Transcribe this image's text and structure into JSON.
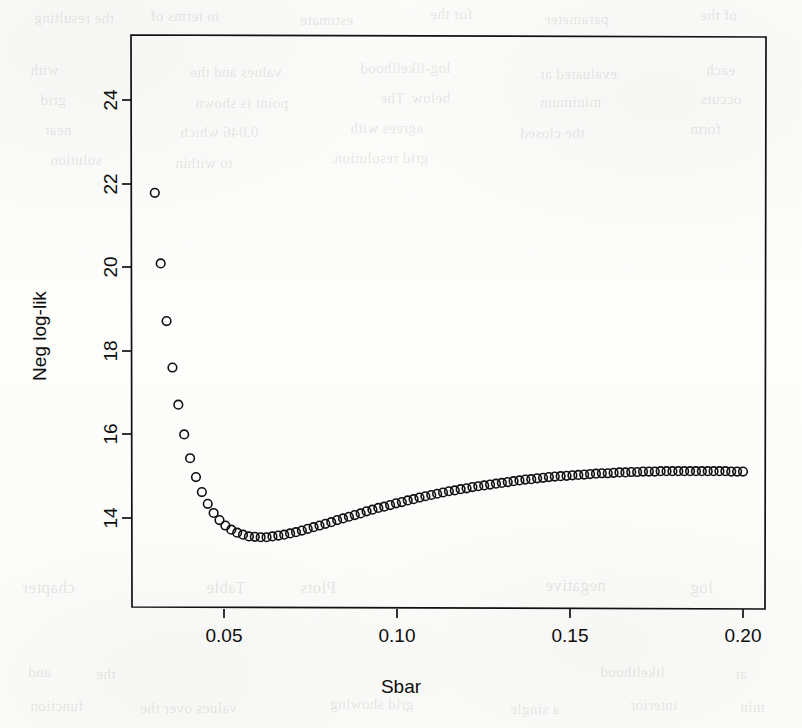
{
  "figure": {
    "background_color": "#fdfdfc",
    "ink_color": "#111111",
    "title": "",
    "xlabel": "Sbar",
    "ylabel": "Neg log-lik"
  },
  "ghost_text": [
    {
      "t": "the resulting",
      "x": 34,
      "y": 10,
      "s": 15
    },
    {
      "t": "in terms of",
      "x": 150,
      "y": 8,
      "s": 15
    },
    {
      "t": "estimate",
      "x": 300,
      "y": 12,
      "s": 15
    },
    {
      "t": "for the",
      "x": 430,
      "y": 6,
      "s": 15
    },
    {
      "t": "parameter",
      "x": 545,
      "y": 11,
      "s": 15
    },
    {
      "t": "of the",
      "x": 700,
      "y": 7,
      "s": 15
    },
    {
      "t": "with",
      "x": 30,
      "y": 62,
      "s": 15
    },
    {
      "t": "values and the",
      "x": 190,
      "y": 64,
      "s": 15
    },
    {
      "t": "log-likelihood",
      "x": 360,
      "y": 60,
      "s": 15
    },
    {
      "t": "evaluated at",
      "x": 540,
      "y": 66,
      "s": 15
    },
    {
      "t": "each",
      "x": 706,
      "y": 62,
      "s": 15
    },
    {
      "t": "grid",
      "x": 40,
      "y": 92,
      "s": 15
    },
    {
      "t": "point is shown",
      "x": 195,
      "y": 95,
      "s": 15
    },
    {
      "t": "below. The",
      "x": 380,
      "y": 90,
      "s": 15
    },
    {
      "t": "minimum",
      "x": 540,
      "y": 94,
      "s": 15
    },
    {
      "t": "occurs",
      "x": 700,
      "y": 91,
      "s": 15
    },
    {
      "t": "near",
      "x": 44,
      "y": 122,
      "s": 15
    },
    {
      "t": "0.046 which",
      "x": 180,
      "y": 124,
      "s": 15
    },
    {
      "t": "agrees with",
      "x": 350,
      "y": 120,
      "s": 15
    },
    {
      "t": "the closed",
      "x": 520,
      "y": 125,
      "s": 15
    },
    {
      "t": "form",
      "x": 690,
      "y": 121,
      "s": 15
    },
    {
      "t": "solution",
      "x": 50,
      "y": 152,
      "s": 15
    },
    {
      "t": "to within",
      "x": 175,
      "y": 155,
      "s": 15
    },
    {
      "t": "grid resolution.",
      "x": 330,
      "y": 150,
      "s": 15
    },
    {
      "t": "chapter",
      "x": 22,
      "y": 578,
      "s": 17
    },
    {
      "t": "Table",
      "x": 206,
      "y": 578,
      "s": 17
    },
    {
      "t": "Plots",
      "x": 300,
      "y": 578,
      "s": 17
    },
    {
      "t": "negative",
      "x": 545,
      "y": 576,
      "s": 17
    },
    {
      "t": "log",
      "x": 690,
      "y": 578,
      "s": 17
    },
    {
      "t": "and",
      "x": 28,
      "y": 664,
      "s": 15
    },
    {
      "t": "the",
      "x": 96,
      "y": 666,
      "s": 15
    },
    {
      "t": "likelihood",
      "x": 600,
      "y": 664,
      "s": 15
    },
    {
      "t": "at",
      "x": 735,
      "y": 666,
      "s": 15
    },
    {
      "t": "function",
      "x": 30,
      "y": 698,
      "s": 15
    },
    {
      "t": "values over the",
      "x": 140,
      "y": 700,
      "s": 15
    },
    {
      "t": "grid showing",
      "x": 330,
      "y": 696,
      "s": 15
    },
    {
      "t": "a single",
      "x": 510,
      "y": 701,
      "s": 15
    },
    {
      "t": "interior",
      "x": 630,
      "y": 697,
      "s": 15
    },
    {
      "t": "min",
      "x": 740,
      "y": 699,
      "s": 15
    }
  ],
  "plot_box": {
    "left": 131,
    "top": 35,
    "right": 766,
    "bottom": 609,
    "border_color": "#111111",
    "border_width": 1.7
  },
  "axes": {
    "x": {
      "label": "Sbar",
      "ticks": [
        0.05,
        0.1,
        0.15,
        0.2
      ],
      "tick_labels": [
        "0.05",
        "0.10",
        "0.15",
        "0.20"
      ],
      "pixel_positions": [
        224,
        397,
        570,
        743
      ],
      "range": [
        0.0215,
        0.2085
      ],
      "tick_length": 9,
      "label_offset": 30
    },
    "y": {
      "label": "Neg log-lik",
      "ticks": [
        14,
        16,
        18,
        20,
        22,
        24
      ],
      "tick_labels": [
        "14",
        "16",
        "18",
        "20",
        "22",
        "24"
      ],
      "pixel_positions": [
        518,
        434,
        351,
        267,
        184,
        100
      ],
      "range": [
        12.16,
        24.99
      ],
      "tick_length": 9,
      "rotated_labels": true
    }
  },
  "marker": {
    "shape": "open-circle",
    "radius": 4.3,
    "stroke": "#111111",
    "stroke_width": 1.6,
    "fill": "none"
  },
  "chart_data": {
    "type": "scatter",
    "title": "",
    "xlabel": "Sbar",
    "ylabel": "Neg log-lik",
    "xlim": [
      0.0215,
      0.2085
    ],
    "ylim": [
      12.16,
      24.99
    ],
    "xticks": [
      0.05,
      0.1,
      0.15,
      0.2
    ],
    "yticks": [
      14,
      16,
      18,
      20,
      22,
      24
    ],
    "grid": false,
    "legend": null,
    "marker": "open circle",
    "n_points": 101,
    "minimum": {
      "x": 0.0464,
      "y": 12.55
    },
    "endpoints": {
      "first": {
        "x": 0.03,
        "y": 21.78
      },
      "last": {
        "x": 0.2,
        "y": 14.74
      }
    },
    "x": [
      0.03,
      0.0317,
      0.0334,
      0.0351,
      0.0368,
      0.0385,
      0.0402,
      0.0419,
      0.0436,
      0.0453,
      0.047,
      0.0487,
      0.0504,
      0.0521,
      0.0538,
      0.0555,
      0.0572,
      0.0589,
      0.0606,
      0.0623,
      0.064,
      0.0657,
      0.0674,
      0.0691,
      0.0708,
      0.0725,
      0.0742,
      0.0759,
      0.0776,
      0.0793,
      0.081,
      0.0827,
      0.0844,
      0.0861,
      0.0878,
      0.0895,
      0.0912,
      0.0929,
      0.0946,
      0.0963,
      0.098,
      0.0997,
      0.1014,
      0.1031,
      0.1048,
      0.1065,
      0.1082,
      0.1099,
      0.1116,
      0.1133,
      0.115,
      0.1167,
      0.1184,
      0.1201,
      0.1218,
      0.1235,
      0.1252,
      0.1269,
      0.1286,
      0.1303,
      0.132,
      0.1337,
      0.1354,
      0.1371,
      0.1388,
      0.1405,
      0.1422,
      0.1439,
      0.1456,
      0.1473,
      0.149,
      0.1507,
      0.1524,
      0.1541,
      0.1558,
      0.1575,
      0.1592,
      0.1609,
      0.1626,
      0.1643,
      0.166,
      0.1677,
      0.1694,
      0.1711,
      0.1728,
      0.1745,
      0.1762,
      0.1779,
      0.1796,
      0.1813,
      0.183,
      0.1847,
      0.1864,
      0.1881,
      0.1898,
      0.1915,
      0.1932,
      0.1949,
      0.1966,
      0.1983,
      0.2
    ],
    "y": [
      21.78,
      20.09,
      18.71,
      17.6,
      16.71,
      16.0,
      15.43,
      14.98,
      14.62,
      14.34,
      14.12,
      13.95,
      13.82,
      13.72,
      13.65,
      13.6,
      13.56,
      13.55,
      13.54,
      13.54,
      13.56,
      13.58,
      13.6,
      13.63,
      13.66,
      13.7,
      13.74,
      13.78,
      13.82,
      13.86,
      13.9,
      13.95,
      13.99,
      14.03,
      14.07,
      14.11,
      14.16,
      14.2,
      14.24,
      14.27,
      14.31,
      14.35,
      14.38,
      14.42,
      14.45,
      14.49,
      14.52,
      14.55,
      14.58,
      14.61,
      14.64,
      14.66,
      14.69,
      14.71,
      14.74,
      14.76,
      14.78,
      14.8,
      14.82,
      14.84,
      14.86,
      14.88,
      14.9,
      14.92,
      14.93,
      14.95,
      14.96,
      14.98,
      14.99,
      15.0,
      15.01,
      15.02,
      15.03,
      15.04,
      15.05,
      15.06,
      15.07,
      15.07,
      15.08,
      15.09,
      15.09,
      15.1,
      15.1,
      15.11,
      15.11,
      15.11,
      15.12,
      15.12,
      15.12,
      15.12,
      15.12,
      15.12,
      15.12,
      15.12,
      15.12,
      15.12,
      15.12,
      15.12,
      15.11,
      15.11,
      15.11
    ]
  }
}
